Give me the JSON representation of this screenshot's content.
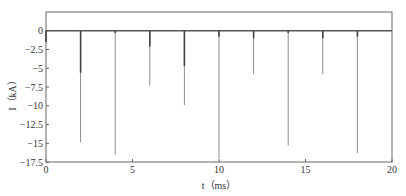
{
  "chart_data": {
    "type": "line",
    "title": "",
    "xlabel": "t（ms）",
    "ylabel": "I（kA）",
    "xlim": [
      0,
      20
    ],
    "ylim": [
      -17.5,
      2.5
    ],
    "grid": false,
    "legend": null,
    "x_ticks": [
      "0",
      "5",
      "10",
      "15",
      "20"
    ],
    "y_ticks": [
      "0",
      "-2.5",
      "-5",
      "-7.5",
      "-10",
      "-12.5",
      "-15",
      "-17.5"
    ],
    "baseline": 0,
    "spikes": [
      {
        "t": 0.0,
        "peak": -1.5,
        "thick_to": -1.5
      },
      {
        "t": 2.0,
        "peak": -14.9,
        "thick_to": -5.6
      },
      {
        "t": 4.0,
        "peak": -16.5,
        "thick_to": -0.3
      },
      {
        "t": 6.0,
        "peak": -7.3,
        "thick_to": -2.1
      },
      {
        "t": 8.0,
        "peak": -9.9,
        "thick_to": -4.7
      },
      {
        "t": 10.0,
        "peak": -17.0,
        "thick_to": -0.8
      },
      {
        "t": 12.0,
        "peak": -5.8,
        "thick_to": -1.0
      },
      {
        "t": 14.0,
        "peak": -15.3,
        "thick_to": -0.3
      },
      {
        "t": 16.0,
        "peak": -5.8,
        "thick_to": -1.0
      },
      {
        "t": 18.0,
        "peak": -16.3,
        "thick_to": -0.8
      }
    ]
  },
  "labels": {
    "xlabel": "t（ms）",
    "ylabel": "I（kA）"
  }
}
